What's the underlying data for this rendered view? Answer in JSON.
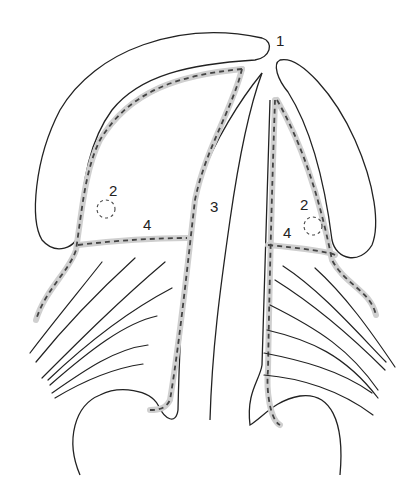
{
  "diagram": {
    "type": "anatomical line drawing",
    "labels": [
      {
        "id": "label-1",
        "text": "1",
        "x": 276,
        "y": 32
      },
      {
        "id": "label-2-left",
        "text": "2",
        "x": 109,
        "y": 182
      },
      {
        "id": "label-2-right",
        "text": "2",
        "x": 300,
        "y": 196
      },
      {
        "id": "label-3",
        "text": "3",
        "x": 210,
        "y": 198
      },
      {
        "id": "label-4-left",
        "text": "4",
        "x": 143,
        "y": 216
      },
      {
        "id": "label-4-right",
        "text": "4",
        "x": 283,
        "y": 224
      }
    ],
    "colors": {
      "line": "#222222",
      "highlight": "#cccccc",
      "dash": "#444444"
    }
  }
}
